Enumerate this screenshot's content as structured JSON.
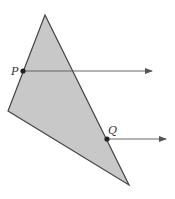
{
  "diagram": {
    "type": "geometry",
    "colors": {
      "fill": "#c8c8c8",
      "stroke": "#444444",
      "arrow": "#555555",
      "point": "#222222"
    },
    "triangle": {
      "vertices": [
        [
          45,
          15
        ],
        [
          8,
          111
        ],
        [
          129,
          185
        ]
      ]
    },
    "points": [
      {
        "label": "P",
        "x": 23,
        "y": 71,
        "label_x": 11,
        "label_y": 75
      },
      {
        "label": "Q",
        "x": 107,
        "y": 139,
        "label_x": 108,
        "label_y": 134
      }
    ],
    "rays": [
      {
        "from": "P",
        "x1": 23,
        "y1": 71,
        "x2": 152,
        "y2": 71
      },
      {
        "from": "Q",
        "x1": 107,
        "y1": 139,
        "x2": 166,
        "y2": 139
      }
    ]
  }
}
